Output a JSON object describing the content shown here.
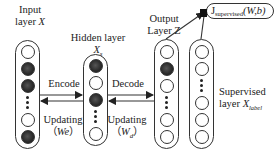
{
  "diagram": {
    "layers": [
      {
        "id": "input",
        "label_line1": "Input",
        "label_line2": "layer",
        "symbol": "X",
        "nodes": [
          "white",
          "dark",
          "dark",
          "ellipsis",
          "white",
          "dark"
        ]
      },
      {
        "id": "hidden",
        "label_line1": "Hidden layer",
        "symbol": "X",
        "symbol_sub": "s",
        "nodes": [
          "dark",
          "white",
          "dark",
          "ellipsis",
          "white"
        ]
      },
      {
        "id": "output",
        "label_line1": "Output",
        "label_line2": "Layer",
        "symbol": "Z",
        "nodes": [
          "white",
          "dark",
          "white",
          "ellipsis",
          "white",
          "white"
        ]
      },
      {
        "id": "supervised",
        "label_line1": "Supervised",
        "label_line2": "layer",
        "symbol": "X",
        "symbol_sub": "label",
        "nodes": [
          "white",
          "white",
          "ellipsis",
          "white",
          "white",
          "white"
        ]
      }
    ],
    "edges": [
      {
        "from": "input",
        "to": "hidden",
        "label": "Encode",
        "direction": "forward"
      },
      {
        "from": "hidden",
        "to": "input",
        "label": "Updating",
        "param": "We",
        "direction": "backward"
      },
      {
        "from": "hidden",
        "to": "output",
        "label": "Decode",
        "direction": "forward"
      },
      {
        "from": "output",
        "to": "hidden",
        "label": "Updating",
        "param": "W",
        "param_sub": "d",
        "direction": "backward"
      },
      {
        "from": "output",
        "to": "loss",
        "direction": "forward"
      },
      {
        "from": "supervised",
        "to": "loss",
        "direction": "forward"
      }
    ],
    "loss": {
      "symbol": "J",
      "sub": "supervised",
      "args": "(W,b)"
    },
    "colors": {
      "line": "#333333",
      "dark_node": "#2a2a2a",
      "background": "#ffffff"
    }
  }
}
